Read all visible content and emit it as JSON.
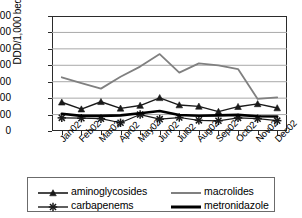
{
  "chart_data": {
    "type": "line",
    "title": "",
    "xlabel": "",
    "ylabel": "DDD/1,000 bed-days",
    "ylim": [
      0,
      700
    ],
    "ytick_step": 100,
    "yticks": [
      700,
      600,
      500,
      400,
      300,
      200,
      100,
      0
    ],
    "grid": "horizontal",
    "legend_position": "bottom",
    "categories": [
      "Jan02",
      "Feb02",
      "Mar02",
      "Apr02",
      "May02",
      "Jun02",
      "Jul02",
      "Aug02",
      "Sep02",
      "Oct02",
      "Nov02",
      "Dec02"
    ],
    "series": [
      {
        "name": "aminoglycosides",
        "marker": "triangle",
        "color": "#1a1a1a",
        "width": 1.4,
        "values": [
          175,
          133,
          178,
          138,
          155,
          202,
          158,
          150,
          118,
          148,
          165,
          140
        ]
      },
      {
        "name": "macrolides",
        "marker": "none",
        "color": "#808080",
        "width": 1.8,
        "values": [
          327,
          292,
          258,
          330,
          392,
          468,
          355,
          412,
          400,
          377,
          195,
          205
        ]
      },
      {
        "name": "carbapenems",
        "marker": "asterisk",
        "color": "#1a1a1a",
        "width": 1.2,
        "values": [
          80,
          78,
          75,
          50,
          100,
          72,
          82,
          65,
          62,
          80,
          75,
          63
        ]
      },
      {
        "name": "metronidazole",
        "marker": "none",
        "color": "#000000",
        "width": 2.6,
        "values": [
          105,
          92,
          92,
          95,
          108,
          122,
          97,
          93,
          95,
          98,
          90,
          88
        ]
      }
    ]
  },
  "legend": {
    "entries": [
      {
        "label": "aminoglycosides",
        "marker": "triangle",
        "color": "#1a1a1a",
        "width": 1.6
      },
      {
        "label": "macrolides",
        "marker": "none",
        "color": "#808080",
        "width": 2.0
      },
      {
        "label": "carbapenems",
        "marker": "asterisk",
        "color": "#1a1a1a",
        "width": 1.4
      },
      {
        "label": "metronidazole",
        "marker": "none",
        "color": "#000000",
        "width": 3.0
      }
    ]
  }
}
